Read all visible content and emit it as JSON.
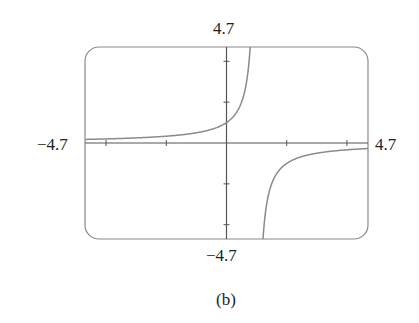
{
  "chart_data": {
    "type": "line",
    "function": "y = -1/(x-1)",
    "series": [
      {
        "name": "curve",
        "domain": [
          -4.7,
          4.7
        ],
        "vertical_asymptote": 1,
        "horizontal_asymptote": 0,
        "points_sample": [
          [
            -4.7,
            0.175
          ],
          [
            -2,
            0.333
          ],
          [
            0,
            1
          ],
          [
            0.5,
            2
          ],
          [
            0.787,
            4.7
          ],
          [
            1.213,
            -4.7
          ],
          [
            1.5,
            -2
          ],
          [
            2,
            -1
          ],
          [
            3,
            -0.5
          ],
          [
            4.7,
            -0.27
          ]
        ]
      }
    ],
    "xlim": [
      -4.7,
      4.7
    ],
    "ylim": [
      -4.7,
      4.7
    ],
    "x_tick_step": 2,
    "y_tick_step": 2,
    "grid": false,
    "labels": {
      "ymax": "4.7",
      "ymin": "−4.7",
      "xmin": "−4.7",
      "xmax": "4.7"
    },
    "caption": "(b)"
  },
  "colors": {
    "frame": "#8a8a8a",
    "axis": "#555555",
    "curve": "#8a8a8a"
  }
}
